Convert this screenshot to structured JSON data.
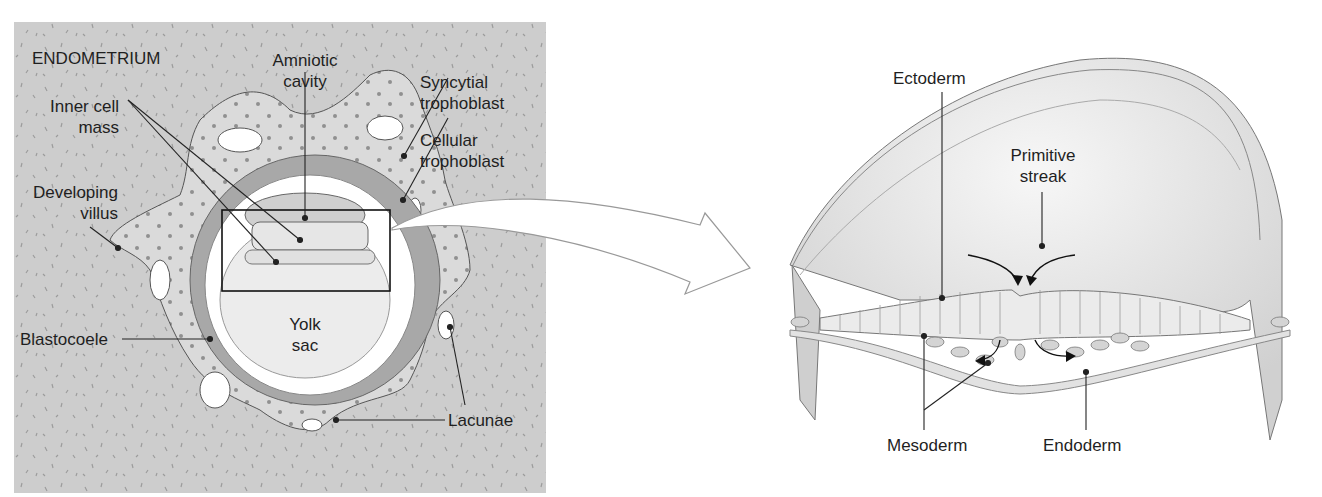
{
  "left_panel": {
    "title": "ENDOMETRIUM",
    "labels": {
      "amniotic_cavity_1": "Amniotic",
      "amniotic_cavity_2": "cavity",
      "inner_cell_mass_1": "Inner cell",
      "inner_cell_mass_2": "mass",
      "syncytial_1": "Syncytial",
      "syncytial_2": "trophoblast",
      "cellular_1": "Cellular",
      "cellular_2": "trophoblast",
      "villus_1": "Developing",
      "villus_2": "villus",
      "blastocoele": "Blastocoele",
      "yolk_1": "Yolk",
      "yolk_2": "sac",
      "lacunae": "Lacunae"
    }
  },
  "right_panel": {
    "labels": {
      "ectoderm": "Ectoderm",
      "primitive_1": "Primitive",
      "primitive_2": "streak",
      "mesoderm": "Mesoderm",
      "endoderm": "Endoderm"
    }
  },
  "colors": {
    "endometrium": "#cfcfcf",
    "syncytial": "#dcdcdc",
    "cellular": "#a6a6a6",
    "line": "#222222"
  }
}
